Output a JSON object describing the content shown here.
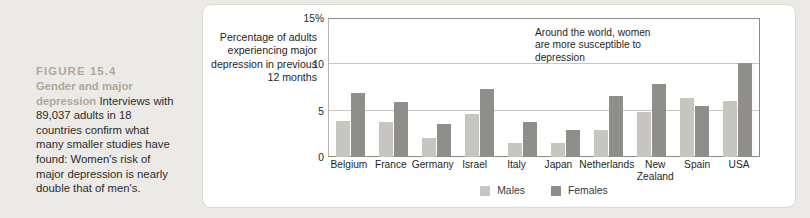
{
  "caption": {
    "figure_number": "FIGURE 15.4",
    "title": "Gender and major depression",
    "body": " Interviews with 89,037 adults in 18 countries confirm what many smaller studies have found: Women's risk of major depression is nearly double that of men's.",
    "heading_color": "#b0a79a",
    "body_color": "#2b2b2b"
  },
  "chart_data": {
    "type": "bar",
    "title": "",
    "xlabel": "",
    "ylabel": "Percentage\nof adults\nexperiencing\nmajor depression\nin previous\n12 months",
    "ylim": [
      0,
      15
    ],
    "yticks": [
      0,
      5,
      10,
      15
    ],
    "ytick_labels": [
      "0",
      "5",
      "10",
      "15%"
    ],
    "grid": true,
    "legend_position": "bottom-center",
    "annotation": "Around the world, women\nare more susceptible to\ndepression",
    "categories": [
      "Belgium",
      "France",
      "Germany",
      "Israel",
      "Italy",
      "Japan",
      "Netherlands",
      "New\nZealand",
      "Spain",
      "USA"
    ],
    "series": [
      {
        "name": "Males",
        "color": "#c6c5c0",
        "values": [
          3.9,
          3.8,
          2.1,
          4.6,
          1.5,
          1.5,
          2.9,
          4.9,
          6.4,
          6.0
        ]
      },
      {
        "name": "Females",
        "color": "#8f8e8a",
        "values": [
          6.9,
          5.9,
          3.6,
          7.3,
          3.8,
          2.9,
          6.6,
          7.9,
          5.5,
          10.1
        ]
      }
    ]
  }
}
